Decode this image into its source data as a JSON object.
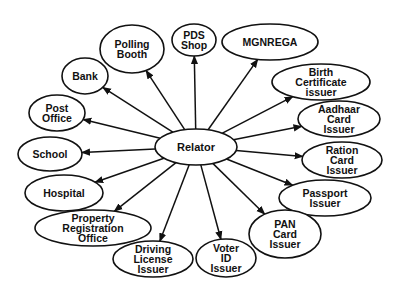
{
  "diagram": {
    "type": "hub-and-spoke",
    "colors": {
      "stroke": "#111111",
      "fill": "#ffffff",
      "text": "#111111"
    },
    "center": {
      "id": "relator",
      "label": "Relator",
      "cx": 196,
      "cy": 147,
      "rx": 41,
      "ry": 18
    },
    "nodes": [
      {
        "id": "pds-shop",
        "lines": [
          "PDS",
          "Shop"
        ],
        "cx": 194,
        "cy": 40,
        "rx": 22,
        "ry": 16
      },
      {
        "id": "mgnrega",
        "lines": [
          "MGNREGA"
        ],
        "cx": 270,
        "cy": 42,
        "rx": 48,
        "ry": 18
      },
      {
        "id": "birth-certificate-issuer",
        "lines": [
          "Birth",
          "Certificate",
          "issuer"
        ],
        "cx": 321,
        "cy": 82,
        "rx": 49,
        "ry": 18
      },
      {
        "id": "aadhaar-card-issuer",
        "lines": [
          "Aadhaar",
          "Card",
          "Issuer"
        ],
        "cx": 339,
        "cy": 119,
        "rx": 41,
        "ry": 18
      },
      {
        "id": "ration-card-issuer",
        "lines": [
          "Ration",
          "Card",
          "Issuer"
        ],
        "cx": 342,
        "cy": 160,
        "rx": 40,
        "ry": 18
      },
      {
        "id": "passport-issuer",
        "lines": [
          "Passport",
          "Issuer"
        ],
        "cx": 325,
        "cy": 198,
        "rx": 46,
        "ry": 18
      },
      {
        "id": "pan-card-issuer",
        "lines": [
          "PAN",
          "Card",
          "Issuer"
        ],
        "cx": 285,
        "cy": 234,
        "rx": 36,
        "ry": 24
      },
      {
        "id": "voter-id-issuer",
        "lines": [
          "Voter",
          "ID",
          "Issuer"
        ],
        "cx": 226,
        "cy": 258,
        "rx": 30,
        "ry": 19
      },
      {
        "id": "driving-license-issuer",
        "lines": [
          "Driving",
          "License",
          "Issuer"
        ],
        "cx": 153,
        "cy": 259,
        "rx": 40,
        "ry": 18
      },
      {
        "id": "property-registration-office",
        "lines": [
          "Property",
          "Registration",
          "Office"
        ],
        "cx": 93,
        "cy": 228,
        "rx": 58,
        "ry": 18
      },
      {
        "id": "hospital",
        "lines": [
          "Hospital"
        ],
        "cx": 64,
        "cy": 193,
        "rx": 39,
        "ry": 18
      },
      {
        "id": "school",
        "lines": [
          "School"
        ],
        "cx": 50,
        "cy": 154,
        "rx": 32,
        "ry": 17
      },
      {
        "id": "post-office",
        "lines": [
          "Post",
          "Office"
        ],
        "cx": 57,
        "cy": 113,
        "rx": 28,
        "ry": 18
      },
      {
        "id": "bank",
        "lines": [
          "Bank"
        ],
        "cx": 85,
        "cy": 76,
        "rx": 23,
        "ry": 18
      },
      {
        "id": "polling-booth",
        "lines": [
          "Polling",
          "Booth"
        ],
        "cx": 132,
        "cy": 49,
        "rx": 32,
        "ry": 24
      }
    ]
  }
}
